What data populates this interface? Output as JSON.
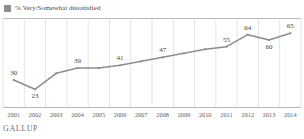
{
  "legend": {
    "swatch_color": "#8d8d8d",
    "label": "% Very/Somewhat dissatisfied"
  },
  "footer": {
    "brand": "GALLUP"
  },
  "chart_data": {
    "type": "line",
    "title": "",
    "subtitle": "",
    "xlabel": "",
    "ylabel": "",
    "grid": "vertical",
    "legend_position": "top-left",
    "line_color": "#8d8d8d",
    "ylim": [
      15,
      72
    ],
    "categories": [
      "2001",
      "2002",
      "2003",
      "2004",
      "2005",
      "2006",
      "2007",
      "2008",
      "2009",
      "2010",
      "2011",
      "2012",
      "2013",
      "2014"
    ],
    "series": [
      {
        "name": "% Very/Somewhat dissatisfied",
        "values": [
          30,
          23,
          35,
          39,
          39,
          41,
          44,
          47,
          50,
          53,
          55,
          64,
          60,
          65
        ],
        "labels": [
          "30",
          "23",
          "",
          "39",
          "",
          "41",
          "",
          "47",
          "",
          "",
          "55",
          "64",
          "60",
          "65"
        ],
        "label_positions": [
          "above",
          "below",
          "",
          "above",
          "",
          "above",
          "",
          "above",
          "",
          "",
          "above",
          "above",
          "below",
          "above"
        ]
      }
    ]
  }
}
